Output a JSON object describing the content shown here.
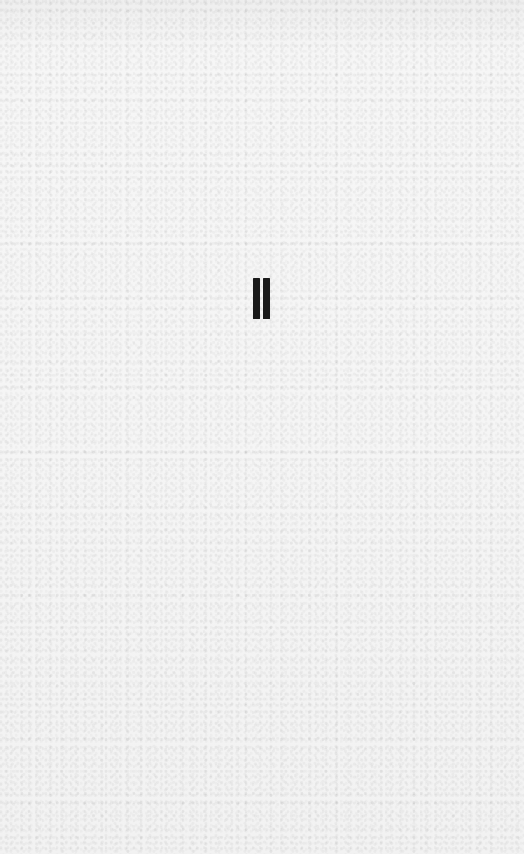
{
  "screen": {
    "background_color": "#f4f4f4",
    "state": "paused"
  },
  "pause_control": {
    "icon": "pause-icon",
    "glyph": "❚❚",
    "color": "#1a1a1a"
  }
}
